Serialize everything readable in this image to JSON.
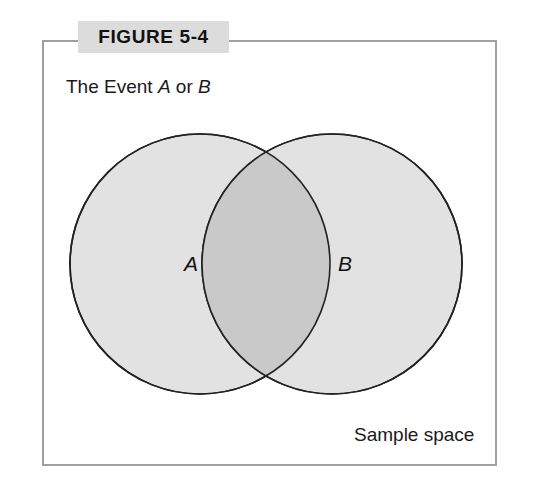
{
  "figure": {
    "banner_label": "FIGURE 5-4",
    "caption_prefix": "The Event ",
    "caption_var_a": "A",
    "caption_conjunction": " or ",
    "caption_var_b": "B",
    "caption_full": "The Event A or B"
  },
  "diagram": {
    "type": "venn",
    "set_a_label": "A",
    "set_b_label": "B",
    "sample_space_label": "Sample space",
    "shaded_region": "union",
    "colors": {
      "frame_border": "#a0a0a0",
      "banner_background": "#dcdcdc",
      "circle_fill": "#e2e2e2",
      "intersection_fill": "#c9c9c9",
      "circle_stroke": "#222222",
      "text": "#111111",
      "page_background": "#ffffff"
    },
    "geometry": {
      "frame": {
        "x": 42,
        "y": 40,
        "width": 455,
        "height": 426
      },
      "circle_a": {
        "cx": 200,
        "cy": 264,
        "r": 130
      },
      "circle_b": {
        "cx": 332,
        "cy": 264,
        "r": 130
      }
    }
  }
}
